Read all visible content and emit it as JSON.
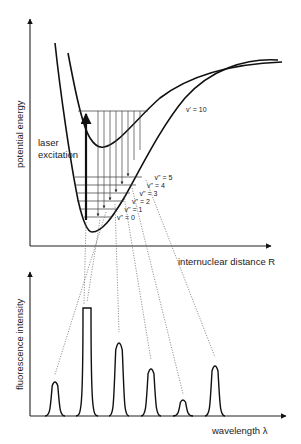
{
  "upper_panel": {
    "y_axis_label": "potential energy",
    "x_axis_label": "internuclear distance R",
    "excitation_label_line1": "laser",
    "excitation_label_line2": "excitation",
    "upper_state_level_label": "v' = 10",
    "lower_state_level_labels": [
      "v\" = 0",
      "v\" = 1",
      "v\" = 2",
      "v\" = 3",
      "v\" = 4",
      "v\" = 5"
    ]
  },
  "lower_panel": {
    "y_axis_label": "fluorescence intensity",
    "x_axis_label": "wavelength λ"
  },
  "chart_data": {
    "type": "line",
    "title": "",
    "xlabel": "wavelength λ",
    "ylabel": "fluorescence intensity",
    "peaks": [
      {
        "index": 1,
        "relative_intensity": 0.33
      },
      {
        "index": 2,
        "relative_intensity": 1.0
      },
      {
        "index": 3,
        "relative_intensity": 0.72
      },
      {
        "index": 4,
        "relative_intensity": 0.46
      },
      {
        "index": 5,
        "relative_intensity": 0.15
      },
      {
        "index": 6,
        "relative_intensity": 0.49
      }
    ]
  },
  "colors": {
    "line": "#111111",
    "dotted": "#666666",
    "background": "#ffffff"
  }
}
